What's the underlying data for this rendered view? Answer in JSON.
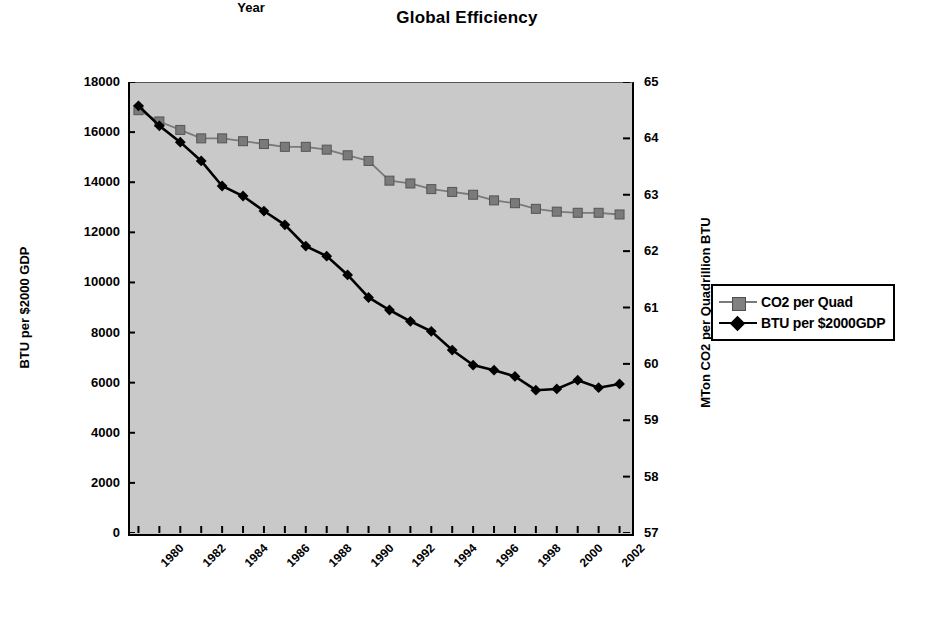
{
  "chart_data": {
    "type": "line",
    "title": "Global Efficiency",
    "xlabel": "Year",
    "grid": false,
    "legend_position": "right",
    "x": [
      1980,
      1981,
      1982,
      1983,
      1984,
      1985,
      1986,
      1987,
      1988,
      1989,
      1990,
      1991,
      1992,
      1993,
      1994,
      1995,
      1996,
      1997,
      1998,
      1999,
      2000,
      2001,
      2002,
      2003
    ],
    "xtick_labels": [
      "1980",
      "1982",
      "1984",
      "1986",
      "1988",
      "1990",
      "1992",
      "1994",
      "1996",
      "1998",
      "2000",
      "2002"
    ],
    "axes": [
      {
        "id": "left",
        "label": "BTU per $2000 GDP",
        "lim": [
          0,
          18000
        ],
        "ticks": [
          0,
          2000,
          4000,
          6000,
          8000,
          10000,
          12000,
          14000,
          16000,
          18000
        ],
        "tick_labels": [
          "0",
          "2000",
          "4000",
          "6000",
          "8000",
          "10000",
          "12000",
          "14000",
          "16000",
          "18000"
        ]
      },
      {
        "id": "right",
        "label": "MTon CO2 per Quadrillion BTU",
        "lim": [
          57,
          65
        ],
        "ticks": [
          57,
          58,
          59,
          60,
          61,
          62,
          63,
          64,
          65
        ],
        "tick_labels": [
          "57",
          "58",
          "59",
          "60",
          "61",
          "62",
          "63",
          "64",
          "65"
        ]
      }
    ],
    "series": [
      {
        "name": "CO2 per Quad",
        "axis": "right",
        "marker": "square",
        "color": "#7a7a7a",
        "line_color": "#7a7a7a",
        "values": [
          64.5,
          64.3,
          64.15,
          64.0,
          64.0,
          63.95,
          63.9,
          63.85,
          63.85,
          63.8,
          63.7,
          63.6,
          63.25,
          63.2,
          63.1,
          63.05,
          63.0,
          62.9,
          62.85,
          62.75,
          62.7,
          62.68,
          62.68,
          62.65
        ]
      },
      {
        "name": "BTU per $2000GDP",
        "axis": "left",
        "marker": "diamond",
        "color": "#000000",
        "line_color": "#000000",
        "values": [
          17050,
          16250,
          15600,
          14850,
          13850,
          13450,
          12850,
          12300,
          11450,
          11050,
          10300,
          9400,
          8900,
          8450,
          8050,
          7300,
          6700,
          6500,
          6250,
          5700,
          5750,
          6100,
          5800,
          5950
        ]
      }
    ]
  },
  "legend": {
    "items": [
      {
        "label": "CO2 per Quad"
      },
      {
        "label": "BTU per $2000GDP"
      }
    ]
  }
}
